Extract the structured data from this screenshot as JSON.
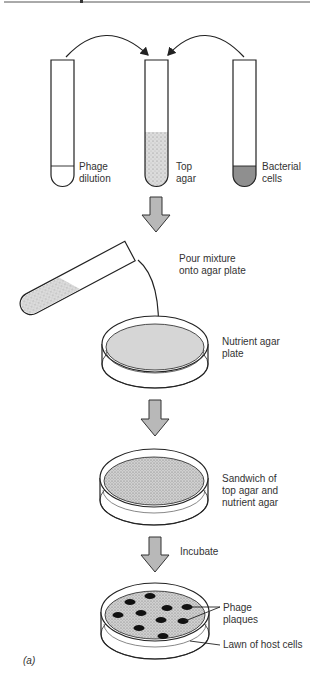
{
  "figure": {
    "panel_label": "(a)",
    "colors": {
      "ink": "#222222",
      "agar_fill": "#d6d6d6",
      "cells_fill": "#8f8f8f",
      "arrow_fill": "#b8b8b8",
      "plaque": "#111111"
    }
  },
  "tubes": [
    {
      "name": "phage-dilution",
      "label_lines": [
        "Phage",
        "dilution"
      ]
    },
    {
      "name": "top-agar",
      "label_lines": [
        "Top",
        "agar"
      ]
    },
    {
      "name": "bacterial-cells",
      "label_lines": [
        "Bacterial",
        "cells"
      ]
    }
  ],
  "steps": {
    "pour": {
      "label_lines": [
        "Pour mixture",
        "onto agar plate"
      ]
    },
    "nutrient_plate": {
      "label_lines": [
        "Nutrient agar",
        "plate"
      ]
    },
    "sandwich": {
      "label_lines": [
        "Sandwich of",
        "top agar and",
        "nutrient agar"
      ]
    },
    "incubate": {
      "label": "Incubate"
    },
    "result": {
      "plaques_label_lines": [
        "Phage",
        "plaques"
      ],
      "lawn_label": "Lawn of host cells",
      "plaque_count": 10
    }
  }
}
